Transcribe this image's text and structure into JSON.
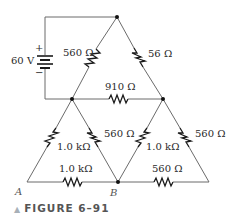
{
  "source": {
    "voltage_label": "60 V",
    "plus": "+",
    "minus": "−"
  },
  "resistors": {
    "top_left": "560 Ω",
    "top_right": "56 Ω",
    "middle": "910 Ω",
    "left_outer": "1.0 kΩ",
    "left_inner": "560 Ω",
    "right_inner": "1.0 kΩ",
    "right_outer": "560 Ω",
    "bottom_left": "1.0 kΩ",
    "bottom_right": "560 Ω"
  },
  "nodes": {
    "a": "A",
    "b": "B"
  },
  "caption": {
    "marker": "▲",
    "text": "FIGURE 6–91"
  }
}
